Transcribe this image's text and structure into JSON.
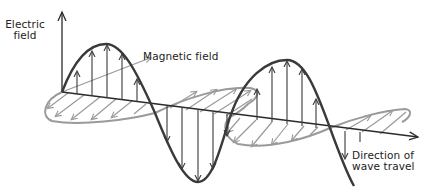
{
  "figure": {
    "labels": {
      "electric_field": [
        "Electric",
        "field"
      ],
      "magnetic_field": "Magnetic field",
      "direction": [
        "Direction of",
        "wave travel"
      ]
    },
    "colors": {
      "electric": "#3a3a3a",
      "magnetic": "#9a9a9a",
      "axis": "#2a2a2a",
      "background": "#ffffff"
    }
  }
}
